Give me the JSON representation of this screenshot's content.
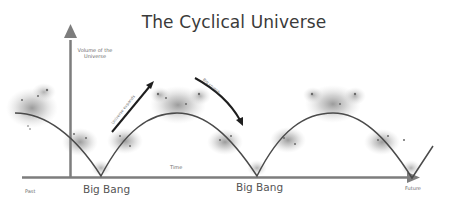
{
  "title": "The Cyclical Universe",
  "axes": {
    "y_label_line1": "Volume of the",
    "y_label_line2": "Universe",
    "x_label": "Time",
    "x_start_label": "Past",
    "x_end_label": "Future"
  },
  "events": [
    {
      "label": "Big Bang"
    },
    {
      "label": "Big Bang"
    }
  ],
  "annotations": {
    "expand": "Universe expands",
    "crunch": "Big crunch"
  },
  "colors": {
    "curve": "#4a4a4a",
    "axis": "#7a7a7a",
    "arrow": "#1e1e1e",
    "galaxy": "#8c8c8c"
  }
}
